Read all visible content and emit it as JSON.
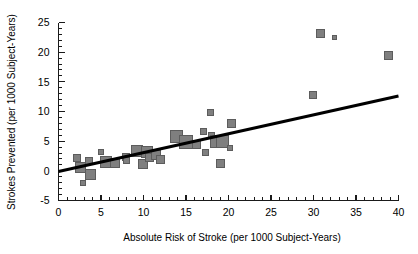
{
  "chart_data": {
    "type": "scatter",
    "title": "",
    "xlabel": "Absolute Risk of Stroke (per 1000 Subject-Years)",
    "ylabel": "Strokes Prevented (per 1000 Subject-Years)",
    "xlim": [
      0,
      40
    ],
    "ylim": [
      -5,
      25
    ],
    "xticks": [
      0,
      5,
      10,
      15,
      20,
      25,
      30,
      35,
      40
    ],
    "xtick_labels": [
      "0",
      "5",
      "10",
      "15",
      "20",
      "25",
      "30",
      "35",
      "40"
    ],
    "xminor_step": 1,
    "yticks": [
      -5,
      0,
      5,
      10,
      15,
      20,
      25
    ],
    "ytick_labels": [
      "-5",
      "0",
      "5",
      "10",
      "15",
      "20",
      "25"
    ],
    "yminor_step": 1,
    "grid": false,
    "legend": null,
    "marker_shape": "square",
    "marker_fill": "#7f7f7f",
    "marker_edge": "#5c5c5c",
    "marker_note": "marker area proportional to study weight",
    "points": [
      {
        "x": 2.2,
        "y": 2.1,
        "size": 7
      },
      {
        "x": 2.6,
        "y": 0.6,
        "size": 10
      },
      {
        "x": 2.9,
        "y": -2.0,
        "size": 5
      },
      {
        "x": 3.6,
        "y": 1.6,
        "size": 7
      },
      {
        "x": 3.8,
        "y": -0.6,
        "size": 10
      },
      {
        "x": 5.0,
        "y": 3.1,
        "size": 5
      },
      {
        "x": 5.6,
        "y": 1.5,
        "size": 11
      },
      {
        "x": 6.6,
        "y": 1.4,
        "size": 9
      },
      {
        "x": 7.9,
        "y": 2.4,
        "size": 7
      },
      {
        "x": 8.0,
        "y": 1.7,
        "size": 6
      },
      {
        "x": 9.2,
        "y": 3.4,
        "size": 11
      },
      {
        "x": 9.9,
        "y": 1.2,
        "size": 9
      },
      {
        "x": 10.4,
        "y": 3.2,
        "size": 11
      },
      {
        "x": 10.7,
        "y": 2.2,
        "size": 8
      },
      {
        "x": 11.5,
        "y": 2.6,
        "size": 9
      },
      {
        "x": 12.0,
        "y": 1.9,
        "size": 8
      },
      {
        "x": 13.9,
        "y": 5.8,
        "size": 12
      },
      {
        "x": 15.0,
        "y": 4.8,
        "size": 13
      },
      {
        "x": 16.2,
        "y": 4.4,
        "size": 8
      },
      {
        "x": 17.0,
        "y": 6.6,
        "size": 6
      },
      {
        "x": 17.3,
        "y": 3.1,
        "size": 6
      },
      {
        "x": 17.9,
        "y": 9.8,
        "size": 6
      },
      {
        "x": 18.0,
        "y": 5.9,
        "size": 6
      },
      {
        "x": 18.6,
        "y": 4.9,
        "size": 12
      },
      {
        "x": 19.1,
        "y": 1.2,
        "size": 8
      },
      {
        "x": 19.3,
        "y": 5.0,
        "size": 12
      },
      {
        "x": 20.2,
        "y": 3.8,
        "size": 5
      },
      {
        "x": 20.3,
        "y": 8.0,
        "size": 8
      },
      {
        "x": 29.9,
        "y": 12.8,
        "size": 7
      },
      {
        "x": 30.8,
        "y": 23.2,
        "size": 8
      },
      {
        "x": 32.5,
        "y": 22.5,
        "size": 4
      },
      {
        "x": 38.8,
        "y": 19.4,
        "size": 8
      }
    ],
    "fit_line": {
      "label": "regression line",
      "x_start": 0,
      "y_start": -0.1,
      "x_end": 40,
      "y_end": 12.6,
      "color": "#000000"
    }
  }
}
